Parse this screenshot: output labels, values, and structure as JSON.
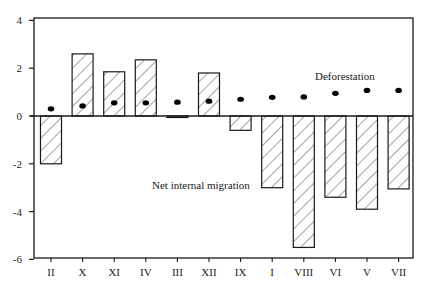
{
  "chart_data": {
    "type": "bar",
    "title": "",
    "xlabel": "",
    "ylabel": "",
    "ylim": [
      -6,
      4
    ],
    "yticks": [
      4,
      2,
      0,
      -2,
      -4,
      -6
    ],
    "grid": false,
    "legend": null,
    "categories": [
      "II",
      "X",
      "XI",
      "IV",
      "III",
      "XII",
      "IX",
      "I",
      "VIII",
      "VI",
      "V",
      "VII"
    ],
    "series": [
      {
        "name": "Net internal migration",
        "style": "hatched-bar",
        "values": [
          -2.0,
          2.6,
          1.85,
          2.35,
          -0.05,
          1.8,
          -0.6,
          -3.0,
          -5.5,
          -3.4,
          -3.9,
          -3.05
        ]
      },
      {
        "name": "Deforestation",
        "style": "dot",
        "values": [
          0.3,
          0.42,
          0.55,
          0.55,
          0.58,
          0.62,
          0.7,
          0.78,
          0.8,
          0.95,
          1.07,
          1.07
        ]
      }
    ],
    "annotations": [
      {
        "text": "Deforestation",
        "x": 315,
        "y": 80
      },
      {
        "text": "Net internal migration",
        "x": 152,
        "y": 189
      }
    ]
  },
  "colors": {
    "axis": "#1a1a1a",
    "bar_fill": "#ffffff",
    "bar_stroke": "#1a1a1a",
    "hatch": "#333333",
    "dot": "#000000"
  }
}
